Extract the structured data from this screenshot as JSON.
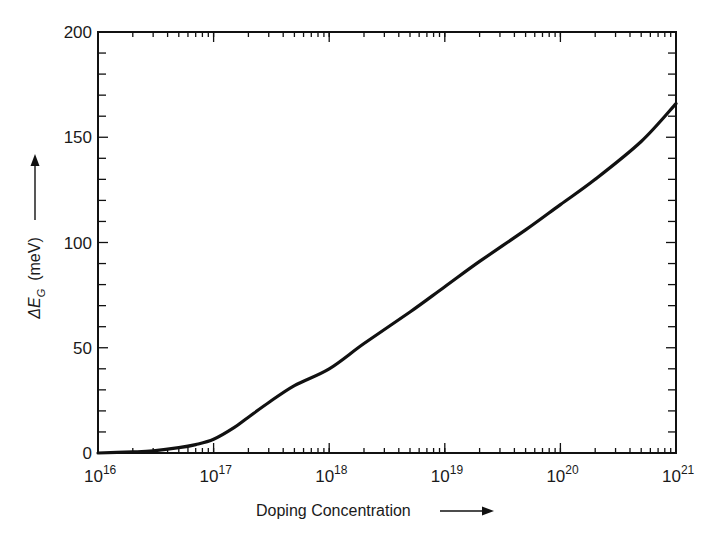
{
  "chart_data": {
    "type": "line",
    "title": "",
    "xlabel": "Doping Concentration",
    "ylabel": "ΔE_G (meV)",
    "ylabel_parts": {
      "symbol": "ΔE",
      "subscript": "G",
      "unit": "(meV)"
    },
    "xscale": "log",
    "xlim": [
      1e+16,
      1e+21
    ],
    "ylim": [
      0,
      200
    ],
    "grid": false,
    "legend": null,
    "x_ticks": [
      {
        "exp": 16,
        "label": "10",
        "sup": "16"
      },
      {
        "exp": 17,
        "label": "10",
        "sup": "17"
      },
      {
        "exp": 18,
        "label": "10",
        "sup": "18"
      },
      {
        "exp": 19,
        "label": "10",
        "sup": "19"
      },
      {
        "exp": 20,
        "label": "10",
        "sup": "20"
      },
      {
        "exp": 21,
        "label": "10",
        "sup": "21"
      }
    ],
    "y_ticks": [
      0,
      50,
      100,
      150,
      200
    ],
    "y_minor_step": 10,
    "series": [
      {
        "name": "Bandgap narrowing",
        "color": "#111111",
        "x": [
          1e+16,
          2e+16,
          3e+16,
          5e+16,
          7e+16,
          1e+17,
          1.5e+17,
          2e+17,
          3e+17,
          5e+17,
          1e+18,
          2e+18,
          5e+18,
          1e+19,
          2e+19,
          5e+19,
          1e+20,
          2e+20,
          5e+20,
          1e+21
        ],
        "y": [
          0,
          0.5,
          1,
          2.5,
          4,
          6.5,
          12,
          17,
          24,
          32,
          40,
          52,
          67,
          79,
          91,
          106,
          118,
          130,
          148,
          166
        ]
      }
    ]
  }
}
